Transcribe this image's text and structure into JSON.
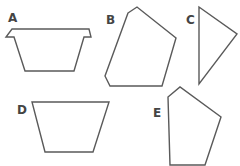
{
  "figure": {
    "background": "#ffffff",
    "stroke_color": "#5a5a5a",
    "label_color": "#444444",
    "shapes": [
      {
        "label": "A",
        "label_pos": [
          8,
          22
        ],
        "points": "12,29 89,29 91,37 84,37 74,71 25,71 14,37 6,37"
      },
      {
        "label": "B",
        "label_pos": [
          106,
          24
        ],
        "points": "128,13 137,7 176,38 162,86 110,86 105,76"
      },
      {
        "label": "C",
        "label_pos": [
          186,
          24
        ],
        "points": "199,7 237,34 199,84"
      },
      {
        "label": "D",
        "label_pos": [
          17,
          114
        ],
        "points": "32,102 109,102 93,152 45,152"
      },
      {
        "label": "E",
        "label_pos": [
          153,
          117
        ],
        "points": "168,97 180,87 221,117 205,165 170,165"
      }
    ]
  }
}
